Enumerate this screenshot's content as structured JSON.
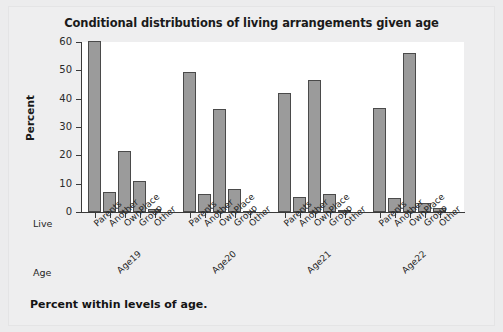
{
  "chart_data": {
    "type": "bar",
    "title": "Conditional distributions of living arrangements given age",
    "xlabel": "",
    "ylabel": "Percent",
    "ylim": [
      0,
      60
    ],
    "yticks": [
      0,
      10,
      20,
      30,
      40,
      50,
      60
    ],
    "grid": false,
    "legend": "none",
    "grouping": "clustered-by-age",
    "categories": [
      "Parents",
      "Another",
      "OwnPlace",
      "Group",
      "Other"
    ],
    "group_axis_label": "Age",
    "category_axis_label": "Live",
    "groups": [
      "Age19",
      "Age20",
      "Age21",
      "Age22"
    ],
    "series": [
      {
        "name": "Age19",
        "values": [
          60.2,
          6.9,
          21.5,
          11.0,
          0.9
        ]
      },
      {
        "name": "Age20",
        "values": [
          49.4,
          6.5,
          36.5,
          8.0,
          0.3
        ]
      },
      {
        "name": "Age21",
        "values": [
          42.1,
          5.4,
          46.6,
          6.5,
          0.7
        ]
      },
      {
        "name": "Age22",
        "values": [
          36.7,
          4.8,
          56.0,
          3.3,
          1.3
        ]
      }
    ],
    "footnote": "Percent within levels of age.",
    "colors": {
      "bar_fill": "#9b9b9b",
      "bar_stroke": "#4a4a4a",
      "plot_background": "#ffffff",
      "page_background": "#ececed",
      "axis": "#3a3a3a",
      "text": "#1a1a1a"
    }
  }
}
